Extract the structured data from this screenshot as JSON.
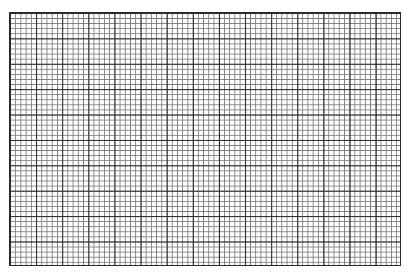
{
  "graph_paper": {
    "major_columns": 15,
    "major_rows": 10,
    "minor_per_major": 5,
    "major_line_color": "#2a2a2a",
    "minor_line_color": "#7a7a7a",
    "background_color": "#ffffff"
  }
}
